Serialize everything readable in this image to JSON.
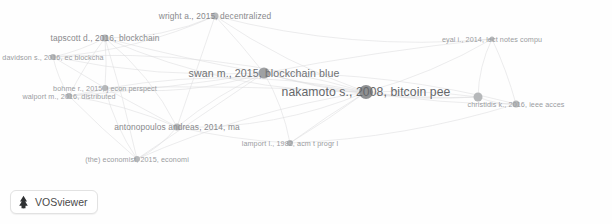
{
  "app": {
    "name": "VOSviewer",
    "logo_icon": "vosviewer-tree-icon",
    "canvas_background": "#fefefe",
    "node_color": "#b6b8ba",
    "edge_color": "#dcdddf",
    "label_color": "#8f9194"
  },
  "chart_data": {
    "type": "scatter",
    "title": "",
    "xlabel": "",
    "ylabel": "",
    "grid": false,
    "legend": "none",
    "xlim": [
      0,
      612
    ],
    "ylim": [
      0,
      224
    ],
    "nodes": [
      {
        "label": "wright a., 2015, decentralized",
        "x": 215,
        "y": 16,
        "size": 7,
        "weight": 3,
        "scale": "md"
      },
      {
        "label": "tapscott d., 2016, blockchain",
        "x": 105,
        "y": 38,
        "size": 7,
        "weight": 3,
        "scale": "md"
      },
      {
        "label": "davidson s., 2016, ec blockcha",
        "x": 53,
        "y": 57,
        "size": 6,
        "weight": 2,
        "scale": "sm"
      },
      {
        "label": "eyal i., 2014, lect notes compu",
        "x": 492,
        "y": 39,
        "size": 5,
        "weight": 2,
        "scale": "sm"
      },
      {
        "label": "swan m., 2015, blockchain blue",
        "x": 264,
        "y": 73,
        "size": 11,
        "weight": 7,
        "scale": "lg"
      },
      {
        "label": "nakamoto s., 2008, bitcoin pee",
        "x": 366,
        "y": 92,
        "size": 14,
        "weight": 9,
        "scale": "xl"
      },
      {
        "label": "bohme r., 2015, j econ perspect",
        "x": 105,
        "y": 88,
        "size": 6,
        "weight": 2,
        "scale": "sm"
      },
      {
        "label": "walport m., 2016, distributed",
        "x": 69,
        "y": 96,
        "size": 6,
        "weight": 2,
        "scale": "sm"
      },
      {
        "label": "",
        "x": 478,
        "y": 97,
        "size": 9,
        "weight": 4,
        "scale": "sm"
      },
      {
        "label": "christidis k., 2016, ieee acces",
        "x": 516,
        "y": 104,
        "size": 7,
        "weight": 3,
        "scale": "sm"
      },
      {
        "label": "antonopoulos andreas, 2014, ma",
        "x": 177,
        "y": 127,
        "size": 7,
        "weight": 3,
        "scale": "md"
      },
      {
        "label": "lamport l., 1982, acm t progr l",
        "x": 290,
        "y": 143,
        "size": 6,
        "weight": 2,
        "scale": "sm"
      },
      {
        "label": "(the) economist, 2015, economi",
        "x": 137,
        "y": 159,
        "size": 6,
        "weight": 2,
        "scale": "sm"
      }
    ],
    "edges": [
      [
        0,
        1
      ],
      [
        0,
        4
      ],
      [
        0,
        5
      ],
      [
        0,
        2
      ],
      [
        0,
        10
      ],
      [
        0,
        3
      ],
      [
        1,
        2
      ],
      [
        1,
        4
      ],
      [
        1,
        5
      ],
      [
        1,
        6
      ],
      [
        1,
        7
      ],
      [
        1,
        10
      ],
      [
        1,
        12
      ],
      [
        2,
        4
      ],
      [
        2,
        5
      ],
      [
        2,
        6
      ],
      [
        2,
        7
      ],
      [
        3,
        5
      ],
      [
        3,
        4
      ],
      [
        3,
        8
      ],
      [
        3,
        9
      ],
      [
        4,
        5
      ],
      [
        4,
        6
      ],
      [
        4,
        7
      ],
      [
        4,
        10
      ],
      [
        4,
        11
      ],
      [
        4,
        12
      ],
      [
        4,
        8
      ],
      [
        4,
        9
      ],
      [
        5,
        6
      ],
      [
        5,
        7
      ],
      [
        5,
        8
      ],
      [
        5,
        9
      ],
      [
        5,
        10
      ],
      [
        5,
        11
      ],
      [
        5,
        12
      ],
      [
        6,
        7
      ],
      [
        6,
        10
      ],
      [
        6,
        12
      ],
      [
        7,
        10
      ],
      [
        7,
        12
      ],
      [
        8,
        9
      ],
      [
        8,
        5
      ],
      [
        10,
        11
      ],
      [
        10,
        12
      ],
      [
        11,
        5
      ],
      [
        11,
        9
      ]
    ]
  }
}
